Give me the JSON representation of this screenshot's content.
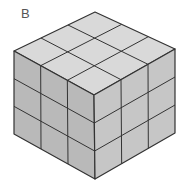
{
  "figure": {
    "label": "B",
    "grid": {
      "rows": 3,
      "cols": 3,
      "layers": 3
    },
    "colors": {
      "top": "#d9d9d9",
      "left": "#b9b9b9",
      "right": "#c6c6c6",
      "edge": "#333333"
    }
  }
}
